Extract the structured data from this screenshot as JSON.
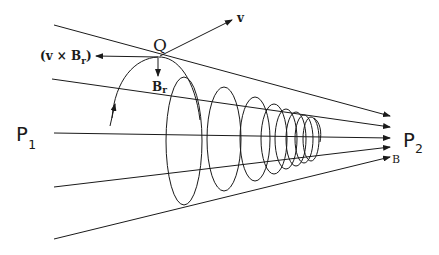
{
  "diagram": {
    "labels": {
      "Q": "Q",
      "v": "v",
      "vxBr": "(v × B",
      "vxBr_sub": "r",
      "vxBr_close": ")",
      "Br": "B",
      "Br_sub": "r",
      "P1": "P",
      "P1_sub": "1",
      "P2": "P",
      "P2_sub": "2",
      "B": "B"
    },
    "colors": {
      "ink": "#1a1a1a",
      "background": "#ffffff"
    }
  }
}
